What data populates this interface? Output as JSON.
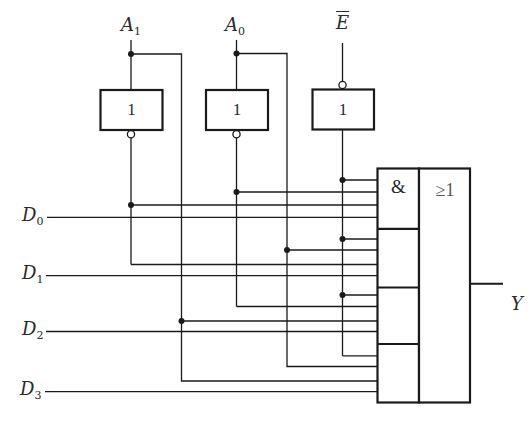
{
  "diagram": {
    "inputs": {
      "address": [
        {
          "name": "A",
          "sub": "1"
        },
        {
          "name": "A",
          "sub": "0"
        }
      ],
      "enable": {
        "name": "E",
        "active_low": true
      },
      "data": [
        {
          "name": "D",
          "sub": "0"
        },
        {
          "name": "D",
          "sub": "1"
        },
        {
          "name": "D",
          "sub": "2"
        },
        {
          "name": "D",
          "sub": "3"
        }
      ]
    },
    "inverters": [
      {
        "id": "inv-a1",
        "symbol": "1",
        "input": "A1",
        "output_inverted": true
      },
      {
        "id": "inv-a0",
        "symbol": "1",
        "input": "A0",
        "output_inverted": true
      },
      {
        "id": "buf-e",
        "symbol": "1",
        "input": "E_bar",
        "input_inverted": true
      }
    ],
    "and_or_block": {
      "and_symbol": "&",
      "or_symbol": "≥1",
      "and_gates": [
        {
          "inputs": [
            "E",
            "A0_bar",
            "A1_bar",
            "D0"
          ]
        },
        {
          "inputs": [
            "E",
            "A0",
            "A1_bar",
            "D1"
          ]
        },
        {
          "inputs": [
            "E",
            "A0_bar",
            "A1",
            "D2"
          ]
        },
        {
          "inputs": [
            "E",
            "A0",
            "A1",
            "D3"
          ]
        }
      ]
    },
    "output": {
      "name": "Y"
    },
    "colors": {
      "line": "#1a1a1a",
      "background": "#ffffff"
    }
  }
}
